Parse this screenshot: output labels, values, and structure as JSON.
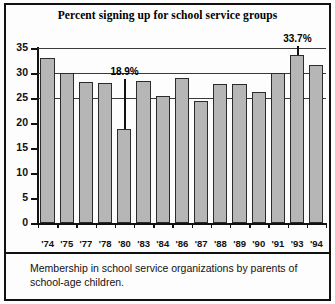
{
  "chart_data": {
    "type": "bar",
    "title": "Percent signing up for school service groups",
    "xlabel": "",
    "ylabel": "",
    "ylim": [
      0,
      35
    ],
    "yticks": [
      0,
      5,
      10,
      15,
      20,
      25,
      30,
      35
    ],
    "grid": true,
    "legend": null,
    "categories": [
      "'74",
      "'75",
      "'77",
      "'78",
      "'80",
      "'83",
      "'84",
      "'86",
      "'87",
      "'88",
      "'89",
      "'90",
      "'91",
      "'93",
      "'94"
    ],
    "values": [
      33.0,
      30.0,
      28.2,
      28.0,
      18.9,
      28.4,
      25.4,
      29.0,
      24.5,
      27.8,
      27.8,
      26.2,
      30.1,
      33.7,
      31.6
    ],
    "annotations": [
      {
        "label": "18.9%",
        "category": "'80",
        "value": 18.9
      },
      {
        "label": "33.7%",
        "category": "'93",
        "value": 33.7
      }
    ]
  },
  "caption": "Membership in school service organizations by parents of school-age children.",
  "colors": {
    "bar_fill": "#b6b6b6",
    "bar_border": "#2b2b2b",
    "axis": "#111111",
    "grid": "#3a3a3a",
    "background": "#fdfdfd"
  }
}
